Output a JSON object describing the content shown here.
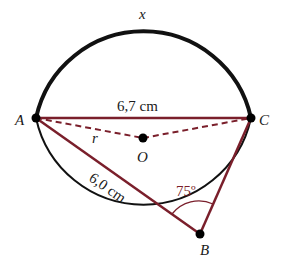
{
  "diagram": {
    "type": "circle-geometry",
    "circle": {
      "center_label": "O",
      "radius_label": "r"
    },
    "points": [
      {
        "id": "A",
        "label": "A"
      },
      {
        "id": "B",
        "label": "B"
      },
      {
        "id": "C",
        "label": "C"
      },
      {
        "id": "O",
        "label": "O"
      }
    ],
    "segments": {
      "AC": {
        "label": "6,7 cm"
      },
      "AB": {
        "label": "6,0 cm"
      },
      "BC": {
        "label": ""
      },
      "AO": {
        "label": "r",
        "style": "dashed"
      },
      "OC": {
        "label": "",
        "style": "dashed"
      }
    },
    "arc": {
      "label": "x",
      "style": "bold major arc AC"
    },
    "angle_B": {
      "label": "75º"
    },
    "colors": {
      "chord": "#7a1f2b",
      "circle": "#111111",
      "point": "#000000"
    }
  }
}
